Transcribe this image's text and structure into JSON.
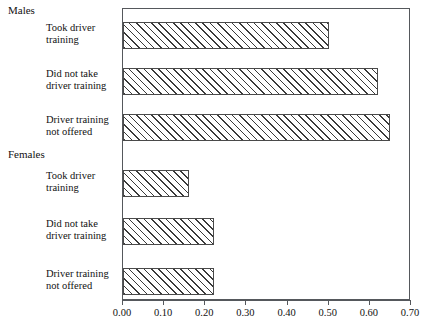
{
  "chart_data": {
    "type": "bar",
    "orientation": "horizontal",
    "title": "",
    "xlabel": "",
    "ylabel": "",
    "xlim": [
      0.0,
      0.7
    ],
    "xticks": [
      0.0,
      0.1,
      0.2,
      0.3,
      0.4,
      0.5,
      0.6,
      0.7
    ],
    "xtick_labels": [
      "0.00",
      "0.10",
      "0.20",
      "0.30",
      "0.40",
      "0.50",
      "0.60",
      "0.70"
    ],
    "grid": false,
    "legend": false,
    "groups": [
      {
        "name": "Males",
        "categories": [
          "Took driver training",
          "Did not take driver training",
          "Driver training not offered"
        ],
        "values": [
          0.5,
          0.62,
          0.65
        ]
      },
      {
        "name": "Females",
        "categories": [
          "Took driver training",
          "Did not take driver training",
          "Driver training not offered"
        ],
        "values": [
          0.16,
          0.22,
          0.22
        ]
      }
    ],
    "bars": [
      {
        "group": "Males",
        "label_line1": "Took driver",
        "label_line2": "training",
        "value": 0.5
      },
      {
        "group": "Males",
        "label_line1": "Did not take",
        "label_line2": "driver training",
        "value": 0.62
      },
      {
        "group": "Males",
        "label_line1": "Driver training",
        "label_line2": "not offered",
        "value": 0.65
      },
      {
        "group": "Females",
        "label_line1": "Took driver",
        "label_line2": "training",
        "value": 0.16
      },
      {
        "group": "Females",
        "label_line1": "Did not take",
        "label_line2": "driver training",
        "value": 0.22
      },
      {
        "group": "Females",
        "label_line1": "Driver training",
        "label_line2": "not offered",
        "value": 0.22
      }
    ],
    "hatch": "forward-diagonal",
    "bar_color": "#ffffff",
    "bar_edge_color": "#4a4a4a",
    "axis_color": "#55585c"
  },
  "groups": {
    "males_label": "Males",
    "females_label": "Females"
  },
  "labels": {
    "b0_l1": "Took driver",
    "b0_l2": "training",
    "b1_l1": "Did not take",
    "b1_l2": "driver training",
    "b2_l1": "Driver training",
    "b2_l2": "not offered",
    "b3_l1": "Took driver",
    "b3_l2": "training",
    "b4_l1": "Did not take",
    "b4_l2": "driver training",
    "b5_l1": "Driver training",
    "b5_l2": "not offered"
  },
  "xticks": {
    "t0": "0.00",
    "t1": "0.10",
    "t2": "0.20",
    "t3": "0.30",
    "t4": "0.40",
    "t5": "0.50",
    "t6": "0.60",
    "t7": "0.70"
  }
}
